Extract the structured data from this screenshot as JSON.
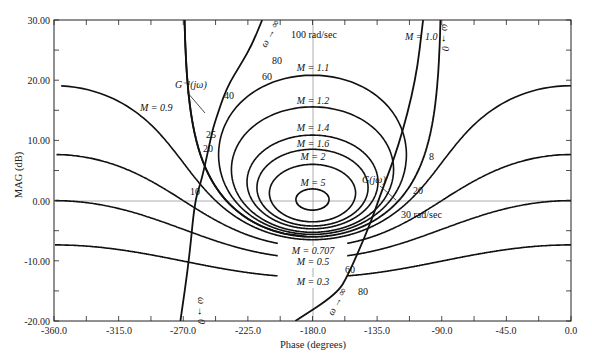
{
  "chart_data": {
    "type": "line",
    "xlabel": "Phase (degrees)",
    "ylabel": "MAG (dB)",
    "xlim": [
      -360,
      0
    ],
    "ylim": [
      -20,
      30
    ],
    "x_ticks": [
      "-360.0",
      "-315.0",
      "-270.0",
      "-225.0",
      "-180.0",
      "-135.0",
      "-90.0",
      "-45.0",
      "0.0"
    ],
    "y_ticks": [
      "30.00",
      "20.00",
      "10.00",
      "0.00",
      "-10.00",
      "-20.00"
    ],
    "grid": "center lines at 0 dB and -180 deg only",
    "m_contours": [
      {
        "label": "M = 0.3",
        "M": 0.3
      },
      {
        "label": "M = 0.5",
        "M": 0.5
      },
      {
        "label": "M = 0.707",
        "M": 0.707
      },
      {
        "label": "M = 0.9",
        "M": 0.9
      },
      {
        "label": "M = 1.0",
        "M": 1.0
      },
      {
        "label": "M = 1.1",
        "M": 1.1
      },
      {
        "label": "M = 1.2",
        "M": 1.2
      },
      {
        "label": "M = 1.4",
        "M": 1.4
      },
      {
        "label": "M = 1.6",
        "M": 1.6
      },
      {
        "label": "M = 2",
        "M": 2
      },
      {
        "label": "M = 5",
        "M": 5
      }
    ],
    "series": [
      {
        "name": "G(jω)",
        "points": [
          {
            "phase": -192,
            "mag": -20
          },
          {
            "phase": -163,
            "mag": -15.5,
            "omega_label": "80"
          },
          {
            "phase": -155,
            "mag": -12.3,
            "omega_label": "60"
          },
          {
            "phase": -140,
            "mag": -4,
            "omega_label": "30 rad/sec"
          },
          {
            "phase": -133,
            "mag": 0.8,
            "omega_label": "20"
          },
          {
            "phase": -120,
            "mag": 9,
            "omega_label": "8"
          },
          {
            "phase": -108,
            "mag": 20
          },
          {
            "phase": -103,
            "mag": 30,
            "omega_label": "ω → 0"
          }
        ]
      },
      {
        "name": "G^-1(jω)",
        "points": [
          {
            "phase": -272,
            "mag": -20,
            "omega_label": "ω → 0"
          },
          {
            "phase": -266,
            "mag": -10
          },
          {
            "phase": -262,
            "mag": 0
          },
          {
            "phase": -257,
            "mag": 3.5,
            "omega_label": "10"
          },
          {
            "phase": -250,
            "mag": 11.3,
            "omega_label": "20"
          },
          {
            "phase": -248,
            "mag": 13,
            "omega_label": "25"
          },
          {
            "phase": -240,
            "mag": 18.7,
            "omega_label": "40"
          },
          {
            "phase": -229,
            "mag": 23,
            "omega_label": "60"
          },
          {
            "phase": -222,
            "mag": 26,
            "omega_label": "80"
          },
          {
            "phase": -215,
            "mag": 30,
            "omega_label": "100 rad/sec"
          }
        ]
      }
    ],
    "annotations": [
      "G(jω)",
      "G^-1(jω)",
      "100 rad/sec",
      "30 rad/sec",
      "ω → ∞",
      "ω → 0"
    ]
  },
  "labels": {
    "xlabel": "Phase (degrees)",
    "ylabel": "MAG (dB)",
    "x_ticks": [
      "-360.0",
      "-315.0",
      "-270.0",
      "-225.0",
      "-180.0",
      "-135.0",
      "-90.0",
      "-45.0",
      "0.0"
    ],
    "y_ticks": [
      "30.00",
      "20.00",
      "10.00",
      "0.00",
      "-10.00",
      "-20.00"
    ],
    "m03": "M = 0.3",
    "m05": "M = 0.5",
    "m0707": "M = 0.707",
    "m09": "M = 0.9",
    "m10": "M = 1.0",
    "m11": "M = 1.1",
    "m12": "M = 1.2",
    "m14": "M = 1.4",
    "m16": "M = 1.6",
    "m2": "M = 2",
    "m5": "M = 5",
    "g": "G(jω)",
    "ginv": "G⁻¹(jω)",
    "w100": "100 rad/sec",
    "w80a": "80",
    "w60a": "60",
    "w40": "40",
    "w25": "25",
    "w20a": "20",
    "w10": "10",
    "w8": "8",
    "w20b": "20",
    "w30": "30 rad/sec",
    "w60b": "60",
    "w80b": "80",
    "winf_top": "ω → ∞",
    "w0_top": "ω → 0",
    "w0_bottom": "ω → 0",
    "winf_bottom": "ω → ∞"
  }
}
